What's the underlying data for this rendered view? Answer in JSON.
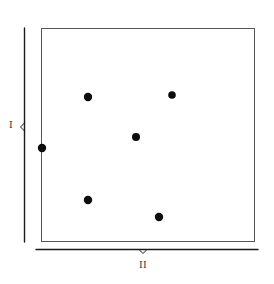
{
  "figure": {
    "kind": "scatter-diagram",
    "background_color": "#ffffff",
    "ink_color": "#1a1a1a",
    "region": {
      "name": "plot-region",
      "shape": "rectangle",
      "x": 41,
      "y": 28,
      "width": 214,
      "height": 214,
      "border_color": "#555555",
      "border_width": 1,
      "fill": "#ffffff"
    },
    "braces": [
      {
        "id": "vertical-brace",
        "orientation": "vertical",
        "label": "I",
        "label_x": 11,
        "label_y": 125,
        "line_x": 24,
        "from": 28,
        "to": 242,
        "notch_at": 127,
        "color": "#1a1a1a"
      },
      {
        "id": "horizontal-brace",
        "orientation": "horizontal",
        "label": "II",
        "label_x": 143,
        "label_y": 265,
        "line_y": 249,
        "from": 36,
        "to": 258,
        "notch_at": 143,
        "color": "#1a1a1a"
      }
    ],
    "points": {
      "count": 6,
      "radius": 4,
      "color": "#0d0d0d",
      "items": [
        {
          "id": "point-1",
          "x": 88,
          "y": 97,
          "r": 4.2
        },
        {
          "id": "point-2",
          "x": 172,
          "y": 95,
          "r": 3.8
        },
        {
          "id": "point-3",
          "x": 136,
          "y": 137,
          "r": 4.0
        },
        {
          "id": "point-4",
          "x": 42,
          "y": 148,
          "r": 4.2
        },
        {
          "id": "point-5",
          "x": 88,
          "y": 200,
          "r": 4.2
        },
        {
          "id": "point-6",
          "x": 159,
          "y": 217,
          "r": 4.2
        }
      ]
    }
  },
  "chart_data": {
    "type": "scatter",
    "title": "",
    "xlabel": "II",
    "ylabel": "I",
    "xlim": [
      41,
      255
    ],
    "ylim": [
      28,
      242
    ],
    "grid": false,
    "legend": null,
    "axis_tick_labels": {
      "x": [],
      "y": []
    },
    "annotations": [
      {
        "text": "I",
        "role": "vertical-extent-brace-label"
      },
      {
        "text": "II",
        "role": "horizontal-extent-brace-label"
      }
    ],
    "series": [
      {
        "name": "points",
        "marker": "filled-circle",
        "color": "#0d0d0d",
        "x": [
          88,
          172,
          136,
          42,
          88,
          159
        ],
        "y": [
          97,
          95,
          137,
          148,
          200,
          217
        ]
      }
    ]
  }
}
